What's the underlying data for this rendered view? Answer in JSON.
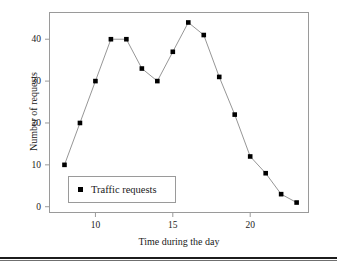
{
  "chart_data": {
    "type": "line",
    "title": "",
    "xlabel": "Time during the day",
    "ylabel": "Number of requests",
    "xlim": [
      7,
      23.8
    ],
    "ylim": [
      -1.5,
      46.5
    ],
    "grid": false,
    "legend_position": "lower-left-inside",
    "x": [
      8,
      9,
      10,
      11,
      12,
      13,
      14,
      15,
      16,
      17,
      18,
      19,
      20,
      21,
      22,
      23
    ],
    "series": [
      {
        "name": "Traffic requests",
        "marker": "square",
        "marker_color": "#000000",
        "line_color": "#8a8a8a",
        "values": [
          10,
          20,
          30,
          40,
          40,
          33,
          30,
          37,
          44,
          41,
          31,
          22,
          12,
          8,
          3,
          1
        ]
      }
    ],
    "xticks": [
      10,
      15,
      20
    ],
    "xtick_labels": [
      "10",
      "15",
      "20"
    ],
    "yticks": [
      0,
      10,
      20,
      30,
      40
    ],
    "ytick_labels": [
      "0",
      "10",
      "20",
      "30",
      "40"
    ]
  },
  "axes": {
    "x_title": "Time during the day",
    "y_title": "Number of requests"
  },
  "legend": {
    "entries": [
      {
        "label": "Traffic requests",
        "marker": "square-marker"
      }
    ]
  },
  "colors": {
    "frame": "#9a9a9a",
    "line": "#8a8a8a",
    "marker": "#000000",
    "text": "#1a1a1a",
    "background": "#ffffff",
    "rule": "#1c1c1c"
  }
}
